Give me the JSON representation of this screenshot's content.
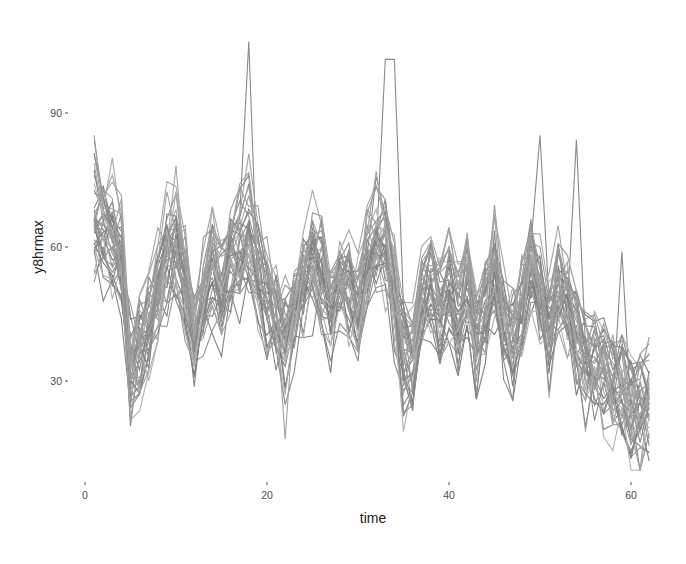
{
  "chart_data": {
    "type": "line",
    "title": "",
    "xlabel": "time",
    "ylabel": "y8hrmax",
    "xlim": [
      -1,
      64
    ],
    "ylim": [
      8,
      108
    ],
    "x_ticks": [
      0,
      20,
      40,
      60
    ],
    "y_ticks": [
      30,
      60,
      90
    ],
    "grid": false,
    "legend": "none",
    "line_color_range": [
      "#7a7a7a",
      "#b0b0b0"
    ],
    "x": [
      1,
      2,
      3,
      4,
      5,
      6,
      7,
      8,
      9,
      10,
      11,
      12,
      13,
      14,
      15,
      16,
      17,
      18,
      19,
      20,
      21,
      22,
      23,
      24,
      25,
      26,
      27,
      28,
      29,
      30,
      31,
      32,
      33,
      34,
      35,
      36,
      37,
      38,
      39,
      40,
      41,
      42,
      43,
      44,
      45,
      46,
      47,
      48,
      49,
      50,
      51,
      52,
      53,
      54,
      55,
      56,
      57,
      58,
      59,
      60,
      61,
      62
    ],
    "mean_profile": [
      66,
      64,
      62,
      58,
      34,
      38,
      42,
      50,
      58,
      60,
      52,
      40,
      48,
      54,
      50,
      56,
      60,
      62,
      54,
      48,
      44,
      40,
      46,
      52,
      56,
      54,
      46,
      52,
      50,
      46,
      56,
      62,
      60,
      48,
      36,
      34,
      48,
      52,
      46,
      50,
      44,
      52,
      40,
      46,
      54,
      44,
      40,
      48,
      56,
      50,
      42,
      52,
      46,
      40,
      36,
      34,
      32,
      30,
      28,
      26,
      24,
      26
    ],
    "series_count": 40,
    "notable_peaks": [
      {
        "time": 18,
        "value": 106
      },
      {
        "time": 33,
        "value": 102
      },
      {
        "time": 34,
        "value": 102
      },
      {
        "time": 50,
        "value": 85
      },
      {
        "time": 54,
        "value": 84
      },
      {
        "time": 59,
        "value": 59
      }
    ],
    "notable_troughs": [
      {
        "time": 5,
        "value": 21
      },
      {
        "time": 22,
        "value": 17
      },
      {
        "time": 61,
        "value": 10
      }
    ]
  },
  "axes": {
    "x_tick_labels": [
      "0",
      "20",
      "40",
      "60"
    ],
    "y_tick_labels": [
      "30",
      "60",
      "90"
    ],
    "x_title": "time",
    "y_title": "y8hrmax"
  }
}
